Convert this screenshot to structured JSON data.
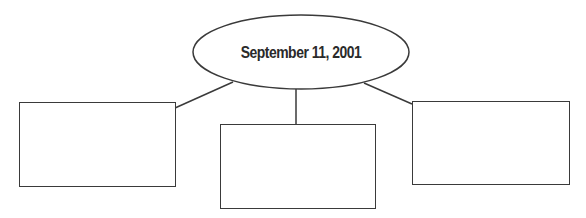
{
  "diagram": {
    "type": "concept-web",
    "center_node": {
      "label": "September 11, 2001",
      "shape": "ellipse"
    },
    "child_nodes": [
      {
        "id": "left",
        "label": "",
        "shape": "rectangle"
      },
      {
        "id": "middle",
        "label": "",
        "shape": "rectangle"
      },
      {
        "id": "right",
        "label": "",
        "shape": "rectangle"
      }
    ],
    "colors": {
      "stroke": "#3a3a3a",
      "text": "#2a2a2a",
      "background": "#ffffff"
    }
  }
}
